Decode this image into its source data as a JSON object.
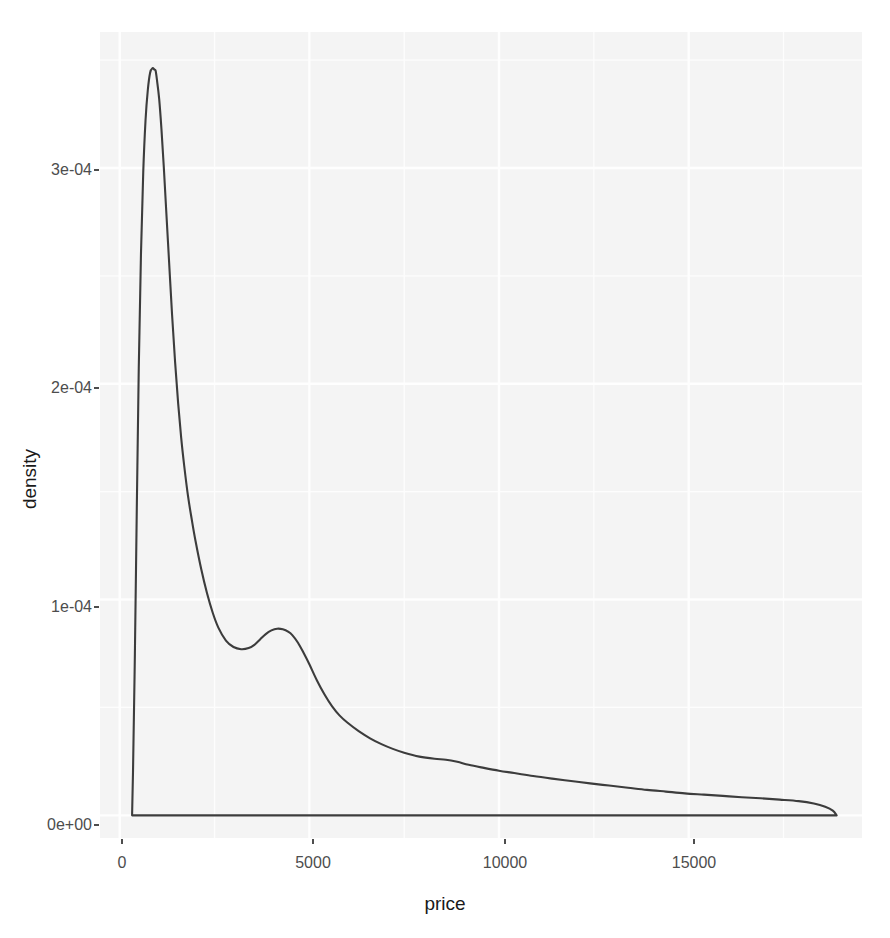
{
  "chart_data": {
    "type": "area",
    "title": "",
    "subtitle": "",
    "xlabel": "price",
    "ylabel": "density",
    "grid": true,
    "legend": false,
    "xlim": [
      -520,
      19570
    ],
    "ylim": [
      -1.05e-05,
      0.000363
    ],
    "xticks": [
      0,
      5000,
      10000,
      15000
    ],
    "xticklabels": [
      "0",
      "5000",
      "10000",
      "15000"
    ],
    "yticks": [
      0,
      0.0001,
      0.0002,
      0.0003
    ],
    "yticklabels": [
      "0e+00",
      "1e-04",
      "2e-04",
      "3e-04"
    ],
    "xminorticks": [
      2500,
      7500,
      12500,
      17500
    ],
    "yminorticks": [
      5e-05,
      0.00015,
      0.00025,
      0.00035
    ],
    "series": [
      {
        "name": "price density",
        "x": [
          326,
          350,
          400,
          450,
          500,
          560,
          620,
          680,
          740,
          800,
          860,
          920,
          947,
          980,
          1040,
          1100,
          1160,
          1220,
          1300,
          1380,
          1460,
          1540,
          1620,
          1700,
          1800,
          1900,
          2000,
          2150,
          2300,
          2450,
          2600,
          2800,
          3000,
          3200,
          3400,
          3550,
          3700,
          3850,
          4000,
          4150,
          4300,
          4450,
          4550,
          4700,
          4850,
          5000,
          5200,
          5400,
          5600,
          5800,
          6000,
          6300,
          6600,
          6900,
          7200,
          7500,
          7900,
          8300,
          8600,
          8900,
          9200,
          9600,
          10000,
          10400,
          10900,
          11400,
          11900,
          12400,
          12900,
          13400,
          13900,
          14400,
          14900,
          15400,
          15900,
          16400,
          16900,
          17400,
          17900,
          18300,
          18600,
          18800,
          18900
        ],
        "y": [
          0.0,
          2e-05,
          7.5e-05,
          0.000142,
          0.000205,
          0.00026,
          0.000298,
          0.000322,
          0.000336,
          0.000344,
          0.0003462,
          0.0003455,
          0.000345,
          0.000341,
          0.000332,
          0.000318,
          0.000301,
          0.000282,
          0.000257,
          0.000232,
          0.00021,
          0.000191,
          0.000175,
          0.000162,
          0.000148,
          0.000137,
          0.000127,
          0.000114,
          0.000103,
          9.4e-05,
          8.7e-05,
          8.1e-05,
          7.8e-05,
          7.7e-05,
          7.75e-05,
          7.9e-05,
          8.15e-05,
          8.4e-05,
          8.57e-05,
          8.65e-05,
          8.62e-05,
          8.5e-05,
          8.35e-05,
          8e-05,
          7.52e-05,
          7e-05,
          6.25e-05,
          5.6e-05,
          5.05e-05,
          4.62e-05,
          4.3e-05,
          3.9e-05,
          3.57e-05,
          3.3e-05,
          3.08e-05,
          2.9e-05,
          2.72e-05,
          2.62e-05,
          2.58e-05,
          2.48e-05,
          2.34e-05,
          2.2e-05,
          2.07e-05,
          1.96e-05,
          1.82e-05,
          1.7e-05,
          1.59e-05,
          1.48e-05,
          1.38e-05,
          1.28e-05,
          1.18e-05,
          1.1e-05,
          1.02e-05,
          9.6e-06,
          9e-06,
          8.4e-06,
          7.9e-06,
          7.3e-06,
          6.6e-06,
          5.5e-06,
          4e-06,
          2.2e-06,
          0.0
        ]
      }
    ],
    "line_color": "#3c3c3c",
    "panel_background": "#f4f4f4",
    "grid_color": "#fefefe",
    "baseline": 0
  },
  "axes": {
    "x_title": "price",
    "y_title": "density",
    "x_tick_labels": [
      "0",
      "5000",
      "10000",
      "15000"
    ],
    "y_tick_labels": [
      "0e+00",
      "1e-04",
      "2e-04",
      "3e-04"
    ]
  }
}
